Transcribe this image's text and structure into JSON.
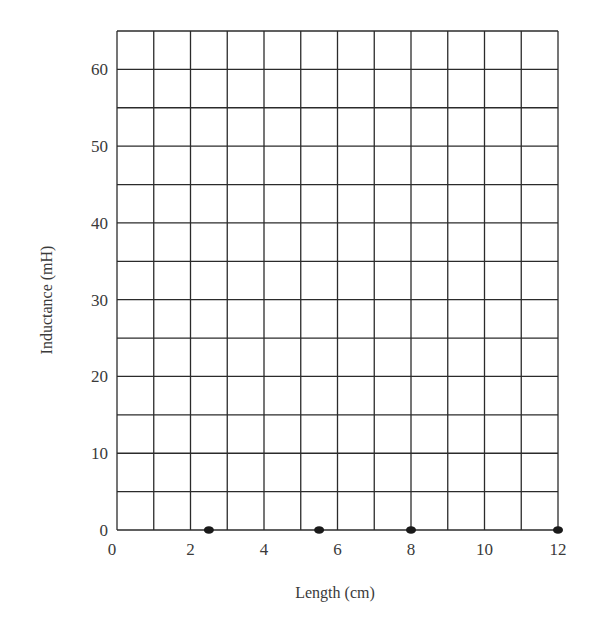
{
  "chart_data": {
    "type": "scatter",
    "title": "",
    "xlabel": "Length (cm)",
    "ylabel": "Inductance (mH)",
    "xlim": [
      0,
      12
    ],
    "ylim": [
      0,
      65
    ],
    "x_ticks": [
      0,
      2,
      4,
      6,
      8,
      10,
      12
    ],
    "y_ticks": [
      0,
      10,
      20,
      30,
      40,
      50,
      60
    ],
    "x_grid_step": 1,
    "y_grid_step": 5,
    "grid": true,
    "legend": null,
    "series": [
      {
        "name": "hand-plotted points",
        "points": [
          {
            "x": 2.5,
            "y": 0
          },
          {
            "x": 5.5,
            "y": 0
          },
          {
            "x": 8,
            "y": 0
          },
          {
            "x": 12,
            "y": 0
          }
        ]
      }
    ]
  },
  "colors": {
    "grid": "#2b2b2b",
    "text": "#3a3a3a",
    "point": "#1a1a1a"
  }
}
